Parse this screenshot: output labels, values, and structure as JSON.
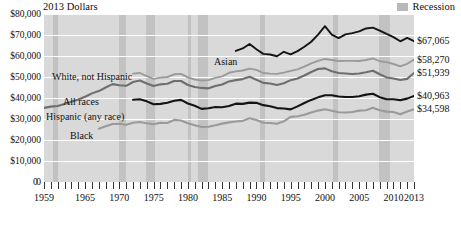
{
  "chart_data": {
    "type": "line",
    "title": "2013 Dollars",
    "xlabel": "",
    "ylabel": "2013 Dollars",
    "xlim": [
      1959,
      2013
    ],
    "ylim": [
      0,
      80000
    ],
    "grid": true,
    "legend_position": "top-right",
    "y_ticks": [
      "0",
      "$10,000",
      "$20,000",
      "$30,000",
      "$40,000",
      "$50,000",
      "$60,000",
      "$70,000",
      "$80,000"
    ],
    "y_tick_values": [
      0,
      10000,
      20000,
      30000,
      40000,
      50000,
      60000,
      70000,
      80000
    ],
    "x_ticks": [
      "1959",
      "1965",
      "1970",
      "1975",
      "1980",
      "1985",
      "1990",
      "1995",
      "2000",
      "2005",
      "2010",
      "2013"
    ],
    "x_tick_values": [
      1959,
      1965,
      1970,
      1975,
      1980,
      1985,
      1990,
      1995,
      2000,
      2005,
      2010,
      2013
    ],
    "legend": [
      {
        "label": "Recession",
        "color": "#c2c2c2"
      }
    ],
    "recessions": [
      {
        "start": 1960.3,
        "end": 1961.1
      },
      {
        "start": 1969.9,
        "end": 1970.9
      },
      {
        "start": 1973.9,
        "end": 1975.2
      },
      {
        "start": 1980.0,
        "end": 1980.5
      },
      {
        "start": 1981.5,
        "end": 1982.9
      },
      {
        "start": 1990.5,
        "end": 1991.2
      },
      {
        "start": 2001.2,
        "end": 2001.9
      },
      {
        "start": 2007.9,
        "end": 2009.5
      }
    ],
    "series": [
      {
        "name": "Asian",
        "label": "Asian",
        "color": "#141414",
        "width": 1.9,
        "end_value_label": "$67,065",
        "end_value": 67065,
        "x": [
          1987,
          1988,
          1989,
          1990,
          1991,
          1992,
          1993,
          1994,
          1995,
          1996,
          1997,
          1998,
          1999,
          2000,
          2001,
          2002,
          2003,
          2004,
          2005,
          2006,
          2007,
          2008,
          2009,
          2010,
          2011,
          2012,
          2013
        ],
        "values": [
          62400,
          63600,
          65700,
          63200,
          61000,
          60700,
          59900,
          62000,
          60800,
          62300,
          64400,
          66800,
          70200,
          74200,
          70200,
          68500,
          70300,
          70900,
          71700,
          73100,
          73500,
          72100,
          70500,
          69000,
          67000,
          68600,
          67065
        ]
      },
      {
        "name": "White, not Hispanic",
        "label": "White, not Hispanic",
        "color": "#9a9a9a",
        "width": 1.9,
        "end_value_label": "$58,270",
        "end_value": 58270,
        "x": [
          1972,
          1973,
          1974,
          1975,
          1976,
          1977,
          1978,
          1979,
          1980,
          1981,
          1982,
          1983,
          1984,
          1985,
          1986,
          1987,
          1988,
          1989,
          1990,
          1991,
          1992,
          1993,
          1994,
          1995,
          1996,
          1997,
          1998,
          1999,
          2000,
          2001,
          2002,
          2003,
          2004,
          2005,
          2006,
          2007,
          2008,
          2009,
          2010,
          2011,
          2012,
          2013
        ],
        "values": [
          51600,
          51900,
          50400,
          49100,
          49700,
          50000,
          51300,
          51500,
          49800,
          48800,
          48300,
          48500,
          49600,
          50300,
          52000,
          52700,
          53100,
          54000,
          53400,
          51900,
          51600,
          51500,
          52100,
          52900,
          53600,
          54900,
          56500,
          57700,
          58600,
          58100,
          57600,
          57700,
          57700,
          57600,
          58100,
          58900,
          57500,
          57100,
          56200,
          55100,
          56300,
          58270
        ]
      },
      {
        "name": "All races",
        "label": "All races",
        "color": "#6e6e6e",
        "width": 2.1,
        "end_value_label": "$51,939",
        "end_value": 51939,
        "x": [
          1959,
          1960,
          1961,
          1962,
          1963,
          1964,
          1965,
          1966,
          1967,
          1968,
          1969,
          1970,
          1971,
          1972,
          1973,
          1974,
          1975,
          1976,
          1977,
          1978,
          1979,
          1980,
          1981,
          1982,
          1983,
          1984,
          1985,
          1986,
          1987,
          1988,
          1989,
          1990,
          1991,
          1992,
          1993,
          1994,
          1995,
          1996,
          1997,
          1998,
          1999,
          2000,
          2001,
          2002,
          2003,
          2004,
          2005,
          2006,
          2007,
          2008,
          2009,
          2010,
          2011,
          2012,
          2013
        ],
        "values": [
          35300,
          35900,
          36200,
          37100,
          38200,
          39300,
          40600,
          42200,
          43300,
          45000,
          46600,
          46100,
          45800,
          47600,
          48300,
          46900,
          45700,
          46500,
          46800,
          48100,
          48100,
          46200,
          45200,
          44800,
          44600,
          45700,
          46400,
          47900,
          48500,
          49000,
          50100,
          48700,
          47200,
          46900,
          46200,
          47000,
          48500,
          49300,
          50700,
          52400,
          53800,
          54100,
          52700,
          51900,
          51700,
          51400,
          51700,
          52300,
          53000,
          51300,
          49800,
          49300,
          48600,
          49100,
          51939
        ]
      },
      {
        "name": "Hispanic (any race)",
        "label": "Hispanic (any race)",
        "color": "#141414",
        "width": 2.1,
        "end_value_label": "$40,963",
        "end_value": 40963,
        "x": [
          1972,
          1973,
          1974,
          1975,
          1976,
          1977,
          1978,
          1979,
          1980,
          1981,
          1982,
          1983,
          1984,
          1985,
          1986,
          1987,
          1988,
          1989,
          1990,
          1991,
          1992,
          1993,
          1994,
          1995,
          1996,
          1997,
          1998,
          1999,
          2000,
          2001,
          2002,
          2003,
          2004,
          2005,
          2006,
          2007,
          2008,
          2009,
          2010,
          2011,
          2012,
          2013
        ],
        "values": [
          39200,
          39400,
          38400,
          37000,
          37200,
          37700,
          38700,
          39100,
          37400,
          36300,
          34800,
          35100,
          35700,
          35600,
          36200,
          37300,
          37200,
          37800,
          37700,
          36600,
          36100,
          35200,
          35000,
          34600,
          36000,
          37600,
          39100,
          40300,
          41300,
          41300,
          40700,
          40500,
          40500,
          40800,
          41600,
          42000,
          40400,
          39400,
          39400,
          39000,
          39700,
          40963
        ]
      },
      {
        "name": "Black",
        "label": "Black",
        "color": "#9a9a9a",
        "width": 2.1,
        "end_value_label": "$34,598",
        "end_value": 34598,
        "x": [
          1967,
          1968,
          1969,
          1970,
          1971,
          1972,
          1973,
          1974,
          1975,
          1976,
          1977,
          1978,
          1979,
          1980,
          1981,
          1982,
          1983,
          1984,
          1985,
          1986,
          1987,
          1988,
          1989,
          1990,
          1991,
          1992,
          1993,
          1994,
          1995,
          1996,
          1997,
          1998,
          1999,
          2000,
          2001,
          2002,
          2003,
          2004,
          2005,
          2006,
          2007,
          2008,
          2009,
          2010,
          2011,
          2012,
          2013
        ],
        "values": [
          25400,
          26600,
          27600,
          27700,
          27300,
          28200,
          28600,
          28000,
          27500,
          28200,
          28100,
          29600,
          29300,
          28000,
          27000,
          26200,
          26300,
          27000,
          27800,
          28400,
          28800,
          29100,
          30400,
          29500,
          28200,
          28100,
          27700,
          28900,
          31000,
          31300,
          32000,
          33100,
          34000,
          34600,
          33900,
          33200,
          33100,
          33300,
          34000,
          34200,
          35400,
          34200,
          33500,
          33300,
          32300,
          33600,
          34598
        ]
      }
    ],
    "inline_labels": [
      {
        "text": "Asian",
        "x": 214,
        "y": 56
      },
      {
        "text": "White, not Hispanic",
        "x": 52,
        "y": 71
      },
      {
        "text": "All races",
        "x": 63,
        "y": 96
      },
      {
        "text": "Hispanic (any race)",
        "x": 46,
        "y": 111
      },
      {
        "text": "Black",
        "x": 70,
        "y": 130
      }
    ]
  }
}
